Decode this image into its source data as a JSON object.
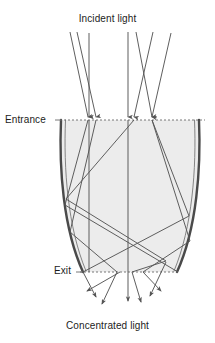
{
  "figure": {
    "type": "optics-ray-diagram",
    "background_color": "#ffffff",
    "labels": {
      "incident": "Incident light",
      "concentrated": "Concentrated light",
      "entrance": "Entrance",
      "exit": "Exit"
    },
    "colors": {
      "wall_stroke": "#4a4a4a",
      "wall_inner_stroke": "#6e6e6e",
      "interior_fill": "#ececec",
      "ray_stroke": "#555555",
      "aperture_dash": "#6a6a6a",
      "text": "#1c1c1c"
    },
    "geometry": {
      "entrance_y": 120,
      "exit_y": 272,
      "entrance_left_x": 61,
      "entrance_right_x": 199,
      "exit_left_x": 83,
      "exit_right_x": 177,
      "entrance_dash_x1": 60,
      "entrance_dash_x2": 205,
      "exit_dash_x1": 80,
      "exit_dash_x2": 180
    },
    "incident_rays": [
      {
        "name": "ray-1",
        "x1": 70,
        "y1": 32,
        "x2": 88,
        "y2": 120
      },
      {
        "name": "ray-2",
        "x1": 77,
        "y1": 32,
        "x2": 96,
        "y2": 120
      },
      {
        "name": "ray-3",
        "x1": 89,
        "y1": 33,
        "x2": 89,
        "y2": 120
      },
      {
        "name": "ray-4",
        "x1": 128,
        "y1": 32,
        "x2": 128,
        "y2": 120
      },
      {
        "name": "ray-5",
        "x1": 136,
        "y1": 32,
        "x2": 152,
        "y2": 120
      },
      {
        "name": "ray-6",
        "x1": 153,
        "y1": 32,
        "x2": 134,
        "y2": 120
      },
      {
        "name": "ray-7",
        "x1": 171,
        "y1": 33,
        "x2": 152,
        "y2": 120
      }
    ],
    "interior_paths": [
      {
        "name": "path-a",
        "points": "88,120 65,205 178,272"
      },
      {
        "name": "path-b",
        "points": "96,120 70,230 118,272"
      },
      {
        "name": "path-c",
        "points": "89,120 89,272"
      },
      {
        "name": "path-d",
        "points": "128,120 128,295"
      },
      {
        "name": "path-e",
        "points": "152,120 188,215 83,272"
      },
      {
        "name": "path-f",
        "points": "134,120 66,200 165,262 120,298"
      },
      {
        "name": "path-g",
        "points": "152,120 190,240 140,300"
      }
    ],
    "exit_rays": [
      {
        "name": "exit-ray-1",
        "x1": 120,
        "y1": 272,
        "x2": 88,
        "y2": 292
      },
      {
        "name": "exit-ray-2",
        "x1": 118,
        "y1": 272,
        "x2": 103,
        "y2": 305
      },
      {
        "name": "exit-ray-3",
        "x1": 128,
        "y1": 272,
        "x2": 128,
        "y2": 302
      },
      {
        "name": "exit-ray-4",
        "x1": 132,
        "y1": 272,
        "x2": 140,
        "y2": 303
      },
      {
        "name": "exit-ray-5",
        "x1": 143,
        "y1": 272,
        "x2": 160,
        "y2": 292
      }
    ],
    "entrance_arrow_xs": [
      88,
      96,
      89,
      128,
      134,
      152
    ],
    "counts": {
      "incident_rays": 7,
      "exit_rays": 5
    }
  }
}
